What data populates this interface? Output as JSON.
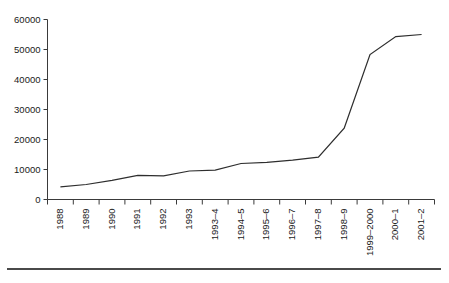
{
  "chart_data": {
    "type": "line",
    "title": "",
    "subtitle": "",
    "xlabel": "",
    "ylabel": "",
    "grid": false,
    "legend": "none",
    "ylim": [
      0,
      60000
    ],
    "ytick_labels": [
      "0",
      "10000",
      "20000",
      "30000",
      "40000",
      "50000",
      "60000"
    ],
    "ytick_values": [
      0,
      10000,
      20000,
      30000,
      40000,
      50000,
      60000
    ],
    "categories": [
      "1988",
      "1989",
      "1990",
      "1991",
      "1992",
      "1993",
      "1993–4",
      "1994–5",
      "1995–6",
      "1996–7",
      "1997–8",
      "1998–9",
      "1999–2000",
      "2000–1",
      "2001–2"
    ],
    "series": [
      {
        "name": "",
        "values": [
          4200,
          5000,
          6400,
          8000,
          7900,
          9500,
          9800,
          12000,
          12400,
          13100,
          14100,
          23800,
          48300,
          54300,
          55000
        ]
      }
    ],
    "annotations": [],
    "line_color": "#2e2e2e"
  },
  "caption": {
    "text": ""
  },
  "axis": {
    "y_axis_name": "y-axis",
    "x_axis_name": "x-axis"
  }
}
